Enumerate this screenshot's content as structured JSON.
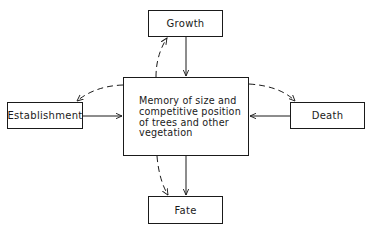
{
  "diagram": {
    "nodes": {
      "growth": "Growth",
      "establishment": "Establishment",
      "death": "Death",
      "fate": "Fate",
      "memory": "Memory of size and competitive position of trees and other vegetation"
    },
    "edges": [
      {
        "from": "growth",
        "to": "memory",
        "style": "solid"
      },
      {
        "from": "establishment",
        "to": "memory",
        "style": "solid"
      },
      {
        "from": "death",
        "to": "memory",
        "style": "solid"
      },
      {
        "from": "memory",
        "to": "fate",
        "style": "solid"
      },
      {
        "from": "memory",
        "to": "growth",
        "style": "dashed"
      },
      {
        "from": "memory",
        "to": "establishment",
        "style": "dashed"
      },
      {
        "from": "memory",
        "to": "death",
        "style": "dashed"
      },
      {
        "from": "memory",
        "to": "fate",
        "style": "dashed"
      }
    ]
  }
}
